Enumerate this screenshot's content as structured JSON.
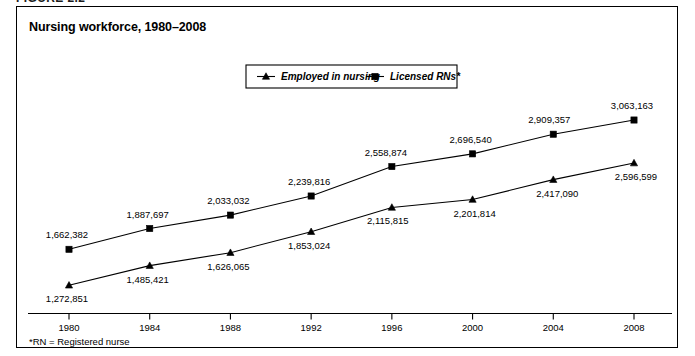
{
  "figure": {
    "caption": "FIGURE 2.2",
    "title": "Nursing workforce, 1980–2008",
    "footnote": "*RN = Registered nurse"
  },
  "legend": {
    "items": [
      {
        "label": "Employed in nursing",
        "marker": "triangle-marker"
      },
      {
        "label": "Licensed RNs*",
        "marker": "square-marker"
      }
    ]
  },
  "chart_data": {
    "type": "line",
    "title": "Nursing workforce, 1980–2008",
    "xlabel": "",
    "ylabel": "",
    "categories": [
      "1980",
      "1984",
      "1988",
      "1992",
      "1996",
      "2000",
      "2004",
      "2008"
    ],
    "x": [
      1980,
      1984,
      1988,
      1992,
      1996,
      2000,
      2004,
      2008
    ],
    "xlim": [
      1980,
      2008
    ],
    "ylim": [
      1200000,
      3150000
    ],
    "grid": false,
    "legend_position": "top-center",
    "axis": {
      "y_visible": false,
      "x_visible": true
    },
    "series": [
      {
        "name": "Licensed RNs*",
        "marker": "square",
        "values": [
          1662382,
          1887697,
          2033032,
          2239816,
          2558874,
          2696540,
          2909357,
          3063163
        ],
        "labels": [
          "1,662,382",
          "1,887,697",
          "2,033,032",
          "2,239,816",
          "2,558,874",
          "2,696,540",
          "2,909,357",
          "3,063,163"
        ]
      },
      {
        "name": "Employed in nursing",
        "marker": "triangle",
        "values": [
          1272851,
          1485421,
          1626065,
          1853024,
          2115815,
          2201814,
          2417090,
          2596599
        ],
        "labels": [
          "1,272,851",
          "1,485,421",
          "1,626,065",
          "1,853,024",
          "2,115,815",
          "2,201,814",
          "2,417,090",
          "2,596,599"
        ]
      }
    ]
  },
  "colors": {
    "ink": "#000000",
    "background": "#ffffff",
    "border": "#000000"
  }
}
